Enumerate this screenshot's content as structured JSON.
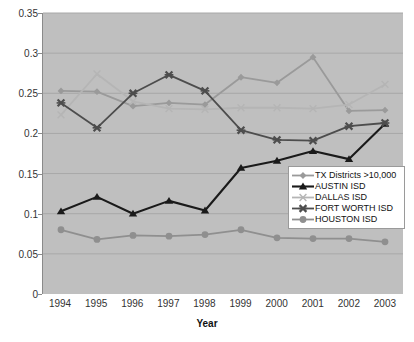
{
  "chart_data": {
    "type": "line",
    "title": "",
    "xlabel": "Year",
    "ylabel": "",
    "categories": [
      "1994",
      "1995",
      "1996",
      "1997",
      "1998",
      "1999",
      "2000",
      "2001",
      "2002",
      "2003"
    ],
    "x": [
      1994,
      1995,
      1996,
      1997,
      1998,
      1999,
      2000,
      2001,
      2002,
      2003
    ],
    "ylim": [
      0,
      0.35
    ],
    "yticks": [
      "0",
      "0.05",
      "0.1",
      "0.15",
      "0.2",
      "0.25",
      "0.3",
      "0.35"
    ],
    "ytick_values": [
      0,
      0.05,
      0.1,
      0.15,
      0.2,
      0.25,
      0.3,
      0.35
    ],
    "grid": true,
    "legend_position": "inside-lower-right",
    "plot_background": "#bfbfbf",
    "series": [
      {
        "name": "TX Districts >10,000",
        "marker": "diamond",
        "color": "#9a9a9a",
        "values": [
          0.253,
          0.252,
          0.234,
          0.238,
          0.236,
          0.27,
          0.263,
          0.295,
          0.228,
          0.229
        ]
      },
      {
        "name": "AUSTIN ISD",
        "marker": "triangle",
        "color": "#1a1a1a",
        "values": [
          0.103,
          0.121,
          0.1,
          0.116,
          0.104,
          0.157,
          0.166,
          0.178,
          0.168,
          0.212
        ]
      },
      {
        "name": "DALLAS ISD",
        "marker": "x-light",
        "color": "#b5b5b5",
        "values": [
          0.223,
          0.274,
          0.24,
          0.231,
          0.23,
          0.232,
          0.232,
          0.231,
          0.236,
          0.261
        ]
      },
      {
        "name": "FORT WORTH ISD",
        "marker": "x-bold",
        "color": "#4d4d4d",
        "values": [
          0.238,
          0.207,
          0.25,
          0.273,
          0.253,
          0.204,
          0.192,
          0.191,
          0.209,
          0.213
        ]
      },
      {
        "name": "HOUSTON ISD",
        "marker": "circle",
        "color": "#8f8f8f",
        "values": [
          0.08,
          0.068,
          0.073,
          0.072,
          0.074,
          0.08,
          0.07,
          0.069,
          0.069,
          0.065
        ]
      }
    ]
  },
  "legend": {
    "items": [
      {
        "label": "TX Districts  >10,000"
      },
      {
        "label": "AUSTIN ISD"
      },
      {
        "label": "DALLAS ISD"
      },
      {
        "label": "FORT WORTH ISD"
      },
      {
        "label": "HOUSTON ISD"
      }
    ]
  },
  "axis": {
    "x_title": "Year"
  }
}
